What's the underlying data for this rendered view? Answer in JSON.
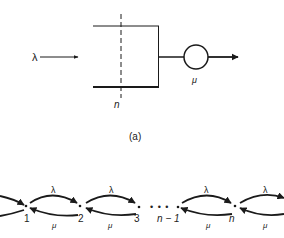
{
  "figure": {
    "queue": {
      "arrival_label": "λ",
      "service_label": "μ",
      "capacity_label": "n",
      "caption": "(a)"
    },
    "chain": {
      "states": [
        {
          "label": "1",
          "x": 26
        },
        {
          "label": "2",
          "x": 80
        },
        {
          "label": "3",
          "x": 138
        },
        {
          "label": "n − 1",
          "x": 178
        },
        {
          "label": "n",
          "x": 234
        }
      ],
      "ellipsis": "• • •",
      "forward_rate": "λ",
      "backward_rate": "μ"
    },
    "colors": {
      "ink": "#1a1a1a",
      "background": "#ffffff"
    }
  }
}
